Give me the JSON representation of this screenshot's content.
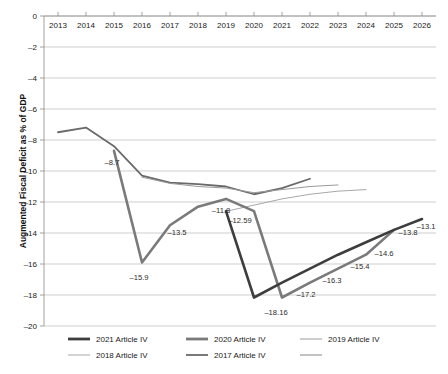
{
  "chart_data": {
    "type": "line",
    "title": "",
    "xlabel": "",
    "ylabel": "Augmented Fiscal Deficit  as % of GDP",
    "x": [
      2013,
      2014,
      2015,
      2016,
      2017,
      2018,
      2019,
      2020,
      2021,
      2022,
      2023,
      2024,
      2025,
      2026
    ],
    "xlim": [
      2012.5,
      2026.5
    ],
    "ylim": [
      -20,
      0
    ],
    "yticks": [
      0,
      -2,
      -4,
      -6,
      -8,
      -10,
      -12,
      -14,
      -16,
      -18,
      -20
    ],
    "ytick_labels": [
      "0",
      "–2",
      "–4",
      "–6",
      "–8",
      "–10",
      "–12",
      "–14",
      "–16",
      "–18",
      "–20"
    ],
    "xtick_labels": [
      "2013",
      "2014",
      "2015",
      "2016",
      "2017",
      "2018",
      "2019",
      "2020",
      "2021",
      "2022",
      "2023",
      "2024",
      "2025",
      "2026"
    ],
    "grid": true,
    "legend_position": "bottom",
    "series": [
      {
        "name": "2021 Article IV",
        "color": "#3d3d3d",
        "width": 2.6,
        "x": [
          2019,
          2020,
          2021,
          2022,
          2023,
          2024,
          2025,
          2026
        ],
        "values": [
          -12.59,
          -18.16,
          -17.2,
          -16.3,
          -15.4,
          -14.6,
          -13.8,
          -13.1
        ]
      },
      {
        "name": "2020 Article IV",
        "color": "#7a7a7a",
        "width": 2.6,
        "x": [
          2015,
          2016,
          2017,
          2018,
          2019,
          2020,
          2021,
          2022,
          2023,
          2024,
          2025
        ],
        "values": [
          -8.7,
          -15.9,
          -13.5,
          -12.3,
          -11.8,
          -12.59,
          -18.16,
          -17.2,
          -16.3,
          -15.4,
          -13.8
        ]
      },
      {
        "name": "2019 Article IV",
        "color": "#9a9a9a",
        "width": 1.0,
        "x": [
          2016,
          2017,
          2018,
          2019,
          2020,
          2021,
          2022,
          2023
        ],
        "values": [
          -10.4,
          -10.8,
          -11.0,
          -11.1,
          -11.4,
          -11.2,
          -11.0,
          -10.9
        ]
      },
      {
        "name": "2018 Article IV",
        "color": "#a8a8a8",
        "width": 1.0,
        "x": [
          2019,
          2020,
          2021,
          2022,
          2023,
          2024
        ],
        "values": [
          -12.6,
          -12.2,
          -11.8,
          -11.5,
          -11.3,
          -11.2
        ]
      },
      {
        "name": "2017 Article IV",
        "color": "#6a6a6a",
        "width": 1.8,
        "x": [
          2013,
          2014,
          2015,
          2016,
          2017,
          2018,
          2019,
          2020,
          2021,
          2022
        ],
        "values": [
          -7.5,
          -7.2,
          -8.4,
          -10.3,
          -10.75,
          -10.85,
          -11.0,
          -11.5,
          -11.1,
          -10.5
        ]
      }
    ],
    "annotations": [
      {
        "text": "–8.7",
        "x": 2015,
        "y": -8.7,
        "dx": -2,
        "dy": 14
      },
      {
        "text": "–15.9",
        "x": 2016,
        "y": -15.9,
        "dx": -3,
        "dy": 18
      },
      {
        "text": "–13.5",
        "x": 2017,
        "y": -13.5,
        "dx": 7,
        "dy": 10
      },
      {
        "text": "–11.8",
        "x": 2019,
        "y": -11.8,
        "dx": -5,
        "dy": 14
      },
      {
        "text": "–12.59",
        "x": 2020,
        "y": -12.59,
        "dx": -14,
        "dy": 12
      },
      {
        "text": "–18.16",
        "x": 2021,
        "y": -18.16,
        "dx": -6,
        "dy": 18
      },
      {
        "text": "–17.2",
        "x": 2022,
        "y": -17.2,
        "dx": -4,
        "dy": 14
      },
      {
        "text": "–16.3",
        "x": 2023,
        "y": -16.3,
        "dx": -6,
        "dy": 14
      },
      {
        "text": "–15.4",
        "x": 2024,
        "y": -15.4,
        "dx": -6,
        "dy": 14
      },
      {
        "text": "–14.6",
        "x": 2025,
        "y": -14.6,
        "dx": -10,
        "dy": 14
      },
      {
        "text": "–13.8",
        "x": 2025,
        "y": -13.8,
        "dx": 14,
        "dy": 5
      },
      {
        "text": "–13.1",
        "x": 2026,
        "y": -13.1,
        "dx": 4,
        "dy": 10
      }
    ]
  },
  "legend": {
    "items": [
      {
        "label": "2021 Article IV",
        "color": "#3d3d3d",
        "width": 2.8
      },
      {
        "label": "2020 Article IV",
        "color": "#7a7a7a",
        "width": 2.8
      },
      {
        "label": "2019 Article IV",
        "color": "#9a9a9a",
        "width": 1.0
      },
      {
        "label": "2018 Article IV",
        "color": "#a8a8a8",
        "width": 1.0
      },
      {
        "label": "2017 Article IV",
        "color": "#6a6a6a",
        "width": 1.8
      },
      {
        "label": "",
        "color": "#9a9a9a",
        "width": 1.2
      }
    ]
  }
}
